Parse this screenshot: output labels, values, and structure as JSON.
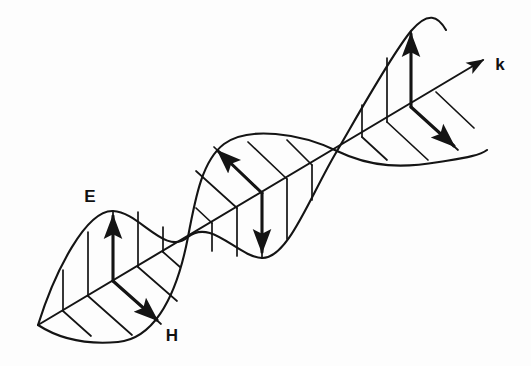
{
  "figure": {
    "background_color": "#fdfdfd",
    "ink_color": "#141414",
    "labels": {
      "electric_field": "E",
      "magnetic_field": "H",
      "wave_vector": "k"
    },
    "label_positions": {
      "electric_field": {
        "x": 90,
        "y": 202
      },
      "magnetic_field": {
        "x": 172,
        "y": 341
      },
      "wave_vector": {
        "x": 500,
        "y": 70
      }
    },
    "axis": {
      "name": "propagation-axis",
      "start": {
        "x": 38,
        "y": 325
      },
      "arrow_tip": {
        "x": 488,
        "y": 57
      },
      "direction_label": "k"
    },
    "nodes": [
      {
        "x": 38,
        "y": 325
      },
      {
        "x": 188,
        "y": 237
      },
      {
        "x": 337,
        "y": 151
      },
      {
        "x": 488,
        "y": 62
      }
    ],
    "lobes": [
      {
        "name": "first-lobe",
        "e_direction": "up",
        "h_direction": "down-right",
        "e_arrow": {
          "x1": 113,
          "y1": 281,
          "x2": 113,
          "y2": 212
        },
        "h_arrow": {
          "x1": 113,
          "y1": 281,
          "x2": 162,
          "y2": 325
        }
      },
      {
        "name": "second-lobe",
        "e_direction": "down",
        "h_direction": "up-left",
        "e_arrow": {
          "x1": 262,
          "y1": 193,
          "x2": 262,
          "y2": 257
        },
        "h_arrow": {
          "x1": 262,
          "y1": 193,
          "x2": 214,
          "y2": 147
        }
      },
      {
        "name": "third-lobe",
        "e_direction": "up",
        "h_direction": "down-right",
        "e_arrow": {
          "x1": 411,
          "y1": 107,
          "x2": 411,
          "y2": 30
        },
        "h_arrow": {
          "x1": 411,
          "y1": 107,
          "x2": 459,
          "y2": 151
        }
      }
    ],
    "waves": [
      {
        "name": "e-wave",
        "plane": "vertical",
        "amplitude_px": 72,
        "period_nodes": 2,
        "description": "Electric field sinusoid in the vertical plane containing k"
      },
      {
        "name": "h-wave",
        "plane": "horizontal",
        "amplitude_px": 70,
        "period_nodes": 2,
        "description": "Magnetic field sinusoid in the plane perpendicular to E, containing k"
      }
    ],
    "hatching": {
      "name": "field-hatch-lines",
      "count_per_lobe": 5,
      "description": "Ruling lines from the propagation axis out to each wave envelope"
    }
  }
}
